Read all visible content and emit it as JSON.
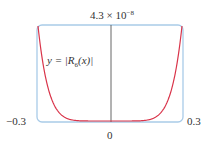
{
  "chart_data": {
    "type": "line",
    "title": "",
    "xlabel": "",
    "ylabel": "",
    "xlim": [
      -0.3,
      0.3
    ],
    "ylim": [
      0,
      4.3e-08
    ],
    "x_tick_labels": [
      "-0.3",
      "0",
      "0.3"
    ],
    "y_tick_labels": [
      "4.3 × 10^-8"
    ],
    "grid": false,
    "legend": null,
    "annotations": [
      "y = |R6(x)|"
    ],
    "series": [
      {
        "name": "y = |R6(x)|",
        "color": "#d9344a",
        "x": [
          -0.3,
          -0.25,
          -0.2,
          -0.15,
          -0.1,
          -0.05,
          0,
          0.05,
          0.1,
          0.15,
          0.2,
          0.25,
          0.3
        ],
        "values": [
          4.3e-08,
          1.44e-08,
          3.8e-09,
          6.7e-10,
          5.9e-11,
          9.2e-13,
          0,
          9.2e-13,
          5.9e-11,
          6.7e-10,
          3.8e-09,
          1.44e-08,
          4.3e-08
        ]
      }
    ]
  },
  "labels": {
    "ymax_mantissa": "4.3 × 10",
    "ymax_exponent": "−8",
    "xmin": "−0.3",
    "xmax": "0.3",
    "xzero": "0",
    "curve_y": "y = |",
    "curve_R": "R",
    "curve_sub": "6",
    "curve_tail": "(x)|"
  },
  "colors": {
    "frame": "#a9cbe8",
    "curve": "#d9344a",
    "axis": "#555555"
  }
}
